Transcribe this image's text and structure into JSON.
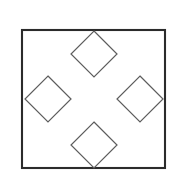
{
  "figure": {
    "title": "Four overlapping diamonds inscribed in a square",
    "background_color": "#ffffff",
    "canvas": {
      "width": 175,
      "height": 182
    }
  },
  "outer_square": {
    "name": "outer-square",
    "x": 22,
    "y": 30,
    "width": 143,
    "height": 138,
    "stroke_color": "#2b2b2b",
    "stroke_width": 2.1,
    "fill": "none"
  },
  "diamonds": {
    "stroke_color": "#5d5d5d",
    "stroke_width": 1.2,
    "fill": "none",
    "half_diagonal": 23,
    "items": [
      {
        "name": "top-diamond",
        "center_x": 94,
        "center_y": 54,
        "points": "94,31 117,54 94,77 71,54"
      },
      {
        "name": "right-diamond",
        "center_x": 140,
        "center_y": 99,
        "points": "140,76 163,99 140,122 117,99"
      },
      {
        "name": "bottom-diamond",
        "center_x": 94,
        "center_y": 145,
        "points": "94,122 117,145 94,168 71,145"
      },
      {
        "name": "left-diamond",
        "center_x": 48,
        "center_y": 99,
        "points": "48,76 71,99 48,122 25,99"
      }
    ]
  },
  "center_region": {
    "name": "central-open-diamond",
    "center_x": 94,
    "center_y": 99,
    "points": "94,77 117,99 94,122 71,99"
  }
}
